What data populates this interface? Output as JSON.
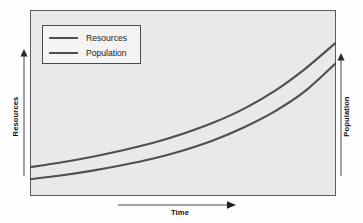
{
  "figure": {
    "background_color": "#fdfdfd",
    "plot_background_color": "#e9e9e9",
    "plot_border_color": "#5a5a5f",
    "curve_color": "#4e4e56"
  },
  "legend": {
    "position": "top-left inside plot",
    "entries": [
      {
        "label": "Resources",
        "swatch": "line-swatch",
        "color": "#4e4e56"
      },
      {
        "label": "Population",
        "swatch": "line-swatch",
        "color": "#4e4e56"
      }
    ]
  },
  "axes": {
    "left": {
      "label": "Resources",
      "arrow": "up-arrow-icon",
      "direction": "up"
    },
    "right": {
      "label": "Population",
      "arrow": "up-arrow-icon",
      "direction": "up"
    },
    "bottom": {
      "label": "Time",
      "arrow": "right-arrow-icon",
      "direction": "right"
    }
  },
  "chart_data": {
    "type": "line",
    "title": "",
    "subtitle": "",
    "xlabel": "Time",
    "ylabel": "Resources",
    "y2label": "Population",
    "xlim": [
      0,
      100
    ],
    "ylim": [
      0,
      100
    ],
    "grid": false,
    "legend_position": "top-left",
    "axis_tick_labels": {
      "x": [],
      "y": []
    },
    "annotations": [],
    "x": [
      0,
      10,
      20,
      30,
      40,
      50,
      60,
      70,
      80,
      90,
      100
    ],
    "series": [
      {
        "name": "Resources",
        "color": "#4e4e56",
        "axis": "left",
        "values": [
          15.5,
          18.0,
          21.0,
          24.5,
          28.5,
          33.5,
          39.5,
          47.0,
          56.5,
          68.5,
          82.5
        ]
      },
      {
        "name": "Population",
        "color": "#4e4e56",
        "axis": "right",
        "values": [
          9.0,
          11.0,
          13.5,
          16.5,
          20.0,
          24.5,
          30.0,
          37.0,
          45.5,
          56.5,
          71.5
        ]
      }
    ]
  }
}
